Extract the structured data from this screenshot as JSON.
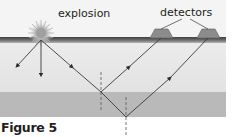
{
  "figure": {
    "caption": "Figure 5",
    "labels": {
      "explosion": "explosion",
      "detectors": "detectors"
    },
    "colors": {
      "sky": "#f4f4f4",
      "surface_band_top": "#4a4a4a",
      "surface_band_bottom": "#9a9a9a",
      "upper_layer": "#e6e6e6",
      "lower_layer": "#b9b9b9",
      "detector": "#8c8c8c",
      "ray": "#3a3a3a",
      "dashed_normal": "#555555",
      "explosion_core": "#a0a0a0"
    },
    "elements": {
      "explosion_source": "starburst",
      "detector_count": 2,
      "direct_rays": 2,
      "reflected_rays": 2,
      "normal_lines": 2,
      "layers": [
        "surface",
        "upper layer",
        "lower layer"
      ]
    }
  }
}
